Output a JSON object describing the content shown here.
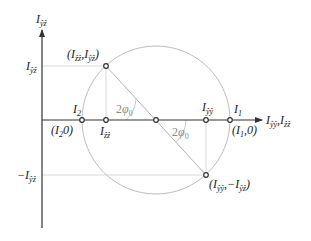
{
  "diagram": {
    "colors": {
      "axis": "#333333",
      "circle": "#bdbdbd",
      "guide": "#c8c8c8",
      "point": "#333333",
      "angle_label": "#888888"
    },
    "axes": {
      "vertical": {
        "main": "I",
        "sub": "ŷẑ"
      },
      "horizontal": {
        "main1": "I",
        "sub1": "ŷŷ",
        "sep": ",",
        "main2": "I",
        "sub2": "ẑẑ"
      }
    },
    "labels": {
      "top_point": {
        "open": "(",
        "m1": "I",
        "s1": "ẑẑ",
        "sep": ",",
        "m2": "I",
        "s2": "ŷẑ",
        "close": ")"
      },
      "bottom_point": {
        "open": "(",
        "m1": "I",
        "s1": "ŷŷ",
        "sep": ",−",
        "m2": "I",
        "s2": "ŷẑ",
        "close": ")"
      },
      "pos_Iyz": {
        "main": "I",
        "sub": "ŷẑ"
      },
      "neg_Iyz": {
        "prefix": "−",
        "main": "I",
        "sub": "ŷẑ"
      },
      "I2": {
        "main": "I",
        "sub": "2"
      },
      "I2_coord": {
        "open": "(",
        "main": "I",
        "sub": "2",
        "rest": "0)"
      },
      "Izz": {
        "main": "I",
        "sub": "ẑẑ"
      },
      "Iyy": {
        "main": "I",
        "sub": "ŷŷ"
      },
      "I1": {
        "main": "I",
        "sub": "1"
      },
      "I1_coord": {
        "open": "(",
        "main": "I",
        "sub": "1",
        "rest": ",0)"
      },
      "angle_upper": {
        "coef": "2",
        "sym": "φ",
        "sub": "0"
      },
      "angle_lower": {
        "coef": "2",
        "sym": "φ",
        "sub": "0"
      }
    }
  }
}
